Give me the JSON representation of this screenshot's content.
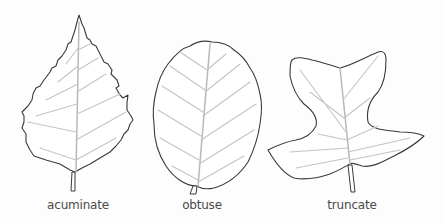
{
  "figure": {
    "leaves": [
      {
        "id": "acuminate",
        "label": "acuminate",
        "label_x": 78
      },
      {
        "id": "obtuse",
        "label": "obtuse",
        "label_x": 202
      },
      {
        "id": "truncate",
        "label": "truncate",
        "label_x": 352
      }
    ]
  },
  "colors": {
    "outline": "#3a3a3a",
    "vein": "#c4c4c4",
    "background": "#fdfdfd",
    "label": "#4a4a4a"
  }
}
